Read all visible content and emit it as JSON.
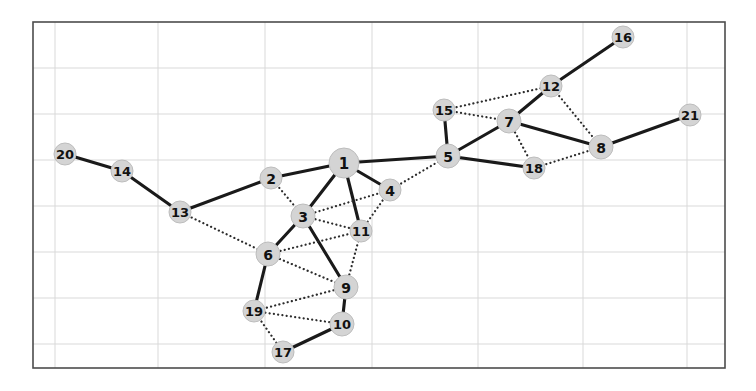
{
  "figure": {
    "type": "network-graph",
    "background_color": "#ffffff",
    "width": 756,
    "height": 391
  },
  "axes": {
    "frame": {
      "x": 33,
      "y": 22,
      "width": 692,
      "height": 346
    },
    "frame_color": "#4d4d4d",
    "grid": {
      "visible": true,
      "color": "#d9d9d9",
      "x_positions": [
        55,
        158,
        265,
        372,
        478,
        583,
        687
      ],
      "y_positions": [
        68,
        114,
        160,
        206,
        252,
        298,
        344
      ]
    }
  },
  "style": {
    "node_fill": "#d4d4d4",
    "node_stroke": "#bdbdbd",
    "node_label_color": "#111111",
    "solid_edge_color": "#1a1a1a",
    "dotted_edge_color": "#2b2b2b",
    "solid_edge_width": 3.1,
    "dotted_edge_width": 2.2
  },
  "chart_data": {
    "type": "graph",
    "title": "",
    "xlabel": "",
    "ylabel": "",
    "node_count": 21,
    "edge_count": 35,
    "nodes": [
      {
        "id": "1",
        "label": "1",
        "x": 344,
        "y": 163,
        "r": 15
      },
      {
        "id": "2",
        "label": "2",
        "x": 271,
        "y": 178,
        "r": 11
      },
      {
        "id": "3",
        "label": "3",
        "x": 303,
        "y": 216,
        "r": 12
      },
      {
        "id": "4",
        "label": "4",
        "x": 390,
        "y": 190,
        "r": 11
      },
      {
        "id": "5",
        "label": "5",
        "x": 448,
        "y": 156,
        "r": 12
      },
      {
        "id": "6",
        "label": "6",
        "x": 268,
        "y": 254,
        "r": 12
      },
      {
        "id": "7",
        "label": "7",
        "x": 509,
        "y": 121,
        "r": 12
      },
      {
        "id": "8",
        "label": "8",
        "x": 601,
        "y": 147,
        "r": 12
      },
      {
        "id": "9",
        "label": "9",
        "x": 346,
        "y": 287,
        "r": 12
      },
      {
        "id": "10",
        "label": "10",
        "x": 342,
        "y": 324,
        "r": 12
      },
      {
        "id": "11",
        "label": "11",
        "x": 361,
        "y": 231,
        "r": 11
      },
      {
        "id": "12",
        "label": "12",
        "x": 551,
        "y": 86,
        "r": 11
      },
      {
        "id": "13",
        "label": "13",
        "x": 180,
        "y": 212,
        "r": 11
      },
      {
        "id": "14",
        "label": "14",
        "x": 122,
        "y": 171,
        "r": 11
      },
      {
        "id": "15",
        "label": "15",
        "x": 444,
        "y": 110,
        "r": 11
      },
      {
        "id": "16",
        "label": "16",
        "x": 623,
        "y": 37,
        "r": 11
      },
      {
        "id": "17",
        "label": "17",
        "x": 283,
        "y": 352,
        "r": 11
      },
      {
        "id": "18",
        "label": "18",
        "x": 534,
        "y": 168,
        "r": 11
      },
      {
        "id": "19",
        "label": "19",
        "x": 254,
        "y": 311,
        "r": 11
      },
      {
        "id": "20",
        "label": "20",
        "x": 65,
        "y": 154,
        "r": 11
      },
      {
        "id": "21",
        "label": "21",
        "x": 690,
        "y": 115,
        "r": 11
      }
    ],
    "edges": [
      {
        "source": "20",
        "target": "14",
        "style": "solid"
      },
      {
        "source": "14",
        "target": "13",
        "style": "solid"
      },
      {
        "source": "13",
        "target": "2",
        "style": "solid"
      },
      {
        "source": "13",
        "target": "6",
        "style": "dotted"
      },
      {
        "source": "2",
        "target": "1",
        "style": "solid"
      },
      {
        "source": "2",
        "target": "3",
        "style": "dotted"
      },
      {
        "source": "1",
        "target": "3",
        "style": "solid"
      },
      {
        "source": "1",
        "target": "4",
        "style": "solid"
      },
      {
        "source": "1",
        "target": "5",
        "style": "solid"
      },
      {
        "source": "1",
        "target": "11",
        "style": "solid"
      },
      {
        "source": "3",
        "target": "6",
        "style": "solid"
      },
      {
        "source": "3",
        "target": "9",
        "style": "solid"
      },
      {
        "source": "3",
        "target": "4",
        "style": "dotted"
      },
      {
        "source": "3",
        "target": "11",
        "style": "dotted"
      },
      {
        "source": "4",
        "target": "5",
        "style": "dotted"
      },
      {
        "source": "4",
        "target": "11",
        "style": "dotted"
      },
      {
        "source": "6",
        "target": "9",
        "style": "dotted"
      },
      {
        "source": "6",
        "target": "11",
        "style": "dotted"
      },
      {
        "source": "6",
        "target": "19",
        "style": "solid"
      },
      {
        "source": "9",
        "target": "11",
        "style": "dotted"
      },
      {
        "source": "9",
        "target": "10",
        "style": "solid"
      },
      {
        "source": "9",
        "target": "19",
        "style": "dotted"
      },
      {
        "source": "10",
        "target": "17",
        "style": "solid"
      },
      {
        "source": "10",
        "target": "19",
        "style": "dotted"
      },
      {
        "source": "19",
        "target": "17",
        "style": "dotted"
      },
      {
        "source": "5",
        "target": "15",
        "style": "solid"
      },
      {
        "source": "5",
        "target": "7",
        "style": "solid"
      },
      {
        "source": "5",
        "target": "18",
        "style": "solid"
      },
      {
        "source": "15",
        "target": "7",
        "style": "dotted"
      },
      {
        "source": "15",
        "target": "12",
        "style": "dotted"
      },
      {
        "source": "7",
        "target": "12",
        "style": "solid"
      },
      {
        "source": "7",
        "target": "8",
        "style": "solid"
      },
      {
        "source": "7",
        "target": "18",
        "style": "dotted"
      },
      {
        "source": "12",
        "target": "16",
        "style": "solid"
      },
      {
        "source": "12",
        "target": "8",
        "style": "dotted"
      },
      {
        "source": "18",
        "target": "8",
        "style": "dotted"
      },
      {
        "source": "8",
        "target": "21",
        "style": "solid"
      }
    ]
  }
}
